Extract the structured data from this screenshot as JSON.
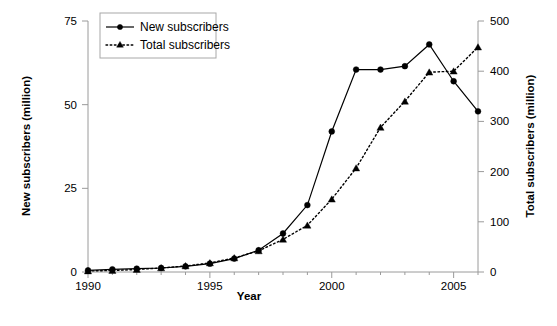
{
  "chart_data": {
    "type": "line",
    "title": "",
    "xlabel": "Year",
    "ylabel": "New subscribers (million)",
    "y2label": "Total subscribers (million)",
    "x": [
      1990,
      1991,
      1992,
      1993,
      1994,
      1995,
      1996,
      1997,
      1998,
      1999,
      2000,
      2001,
      2002,
      2003,
      2004,
      2005,
      2006
    ],
    "xlim": [
      1990,
      2006
    ],
    "xticks": [
      1990,
      1995,
      2000,
      2005
    ],
    "xticklabels": [
      "1990",
      "1995",
      "2000",
      "2005"
    ],
    "ylim": [
      0,
      75
    ],
    "yticks": [
      0,
      25,
      50,
      75
    ],
    "yticklabels": [
      "0",
      "25",
      "50",
      "75"
    ],
    "y2lim": [
      0,
      500
    ],
    "y2ticks": [
      0,
      100,
      200,
      300,
      400,
      500
    ],
    "y2ticklabels": [
      "0",
      "100",
      "200",
      "300",
      "400",
      "500"
    ],
    "grid": false,
    "legend_position": "top-left",
    "series": [
      {
        "name": "New subscribers",
        "axis": "left",
        "marker": "circle",
        "linestyle": "solid",
        "color": "#000000",
        "values": [
          0.5,
          0.8,
          1.0,
          1.2,
          1.7,
          2.5,
          4.0,
          6.5,
          11.5,
          20.0,
          42.0,
          60.5,
          60.5,
          61.5,
          68.0,
          57.0,
          48.0
        ]
      },
      {
        "name": "Total subscribers",
        "axis": "right",
        "marker": "triangle",
        "linestyle": "dotted",
        "color": "#000000",
        "values": [
          2,
          3,
          5,
          8,
          12,
          18,
          28,
          42,
          65,
          93,
          145,
          207,
          288,
          340,
          398,
          400,
          448
        ]
      }
    ]
  },
  "legend": {
    "items": [
      {
        "label": "New subscribers",
        "marker": "circle",
        "style": "solid"
      },
      {
        "label": "Total subscribers",
        "marker": "triangle",
        "style": "dotted"
      }
    ]
  },
  "axes": {
    "left_title": "New subscribers (million)",
    "right_title": "Total subscribers (million)",
    "bottom_title": "Year"
  },
  "colors": {
    "ink": "#000000",
    "axis": "#9a9a9a",
    "background": "#ffffff"
  }
}
